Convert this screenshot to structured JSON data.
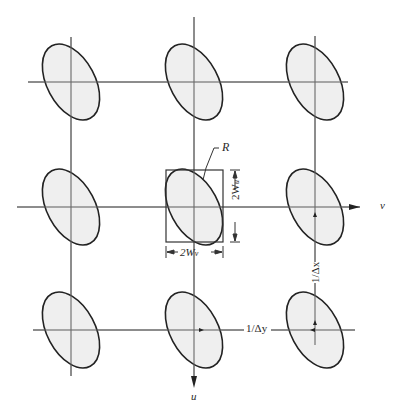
{
  "diagram": {
    "type": "lattice-of-ellipses",
    "colors": {
      "line": "#555555",
      "ellipse_stroke": "#222222",
      "ellipse_fill": "#ececec",
      "background": "#ffffff"
    },
    "labels": {
      "region": "R",
      "height_label": "2W",
      "height_sub": "u",
      "width_label": "2W",
      "width_sub": "v",
      "axis_v": "v",
      "axis_u": "u",
      "spacing_x": "1/Δx",
      "spacing_y": "1/Δy"
    },
    "grid": {
      "columns_x": [
        71,
        194,
        315
      ],
      "rows_y": [
        82,
        207,
        330
      ]
    }
  }
}
